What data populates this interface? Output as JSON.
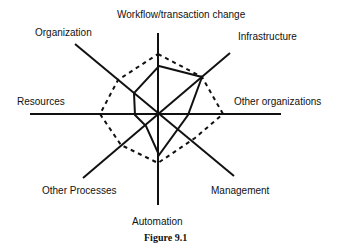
{
  "diagram": {
    "type": "radar",
    "axes": [
      {
        "label": "Workflow/transaction change"
      },
      {
        "label": "Infrastructure"
      },
      {
        "label": "Other organizations"
      },
      {
        "label": "Management"
      },
      {
        "label": "Automation"
      },
      {
        "label": "Other Processes"
      },
      {
        "label": "Resources"
      },
      {
        "label": "Organization"
      }
    ],
    "caption": "Figure 9.1",
    "series": [
      {
        "name": "solid-profile",
        "style": "solid"
      },
      {
        "name": "dashed-reference",
        "style": "dashed"
      }
    ]
  }
}
